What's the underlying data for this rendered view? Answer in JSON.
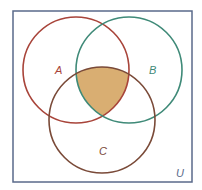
{
  "diagram": {
    "type": "venn",
    "universe": {
      "label": "U",
      "border_color": "#5a6a8a"
    },
    "sets": [
      {
        "id": "A",
        "label": "A",
        "color": "#a8443a"
      },
      {
        "id": "B",
        "label": "B",
        "color": "#3f8a78"
      },
      {
        "id": "C",
        "label": "C",
        "color": "#7a4a38"
      }
    ],
    "shaded_region": {
      "expression": "A ∩ B ∩ C",
      "fill": "#d9ae72"
    }
  }
}
